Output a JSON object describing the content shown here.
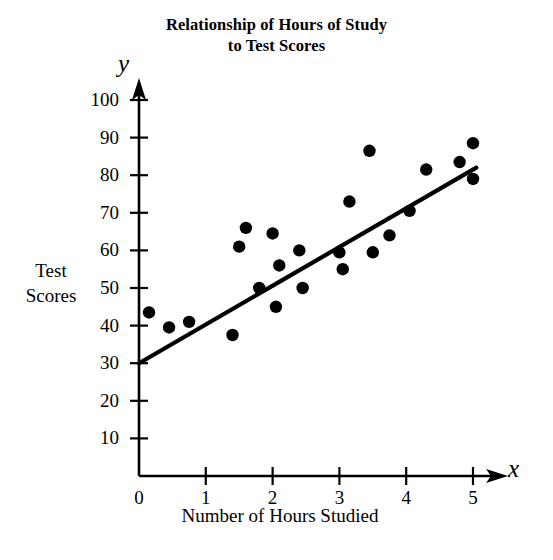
{
  "chart_data": {
    "type": "scatter",
    "title": "Relationship of Hours of Study to Test Scores",
    "title_lines": [
      "Relationship of Hours of Study",
      "to Test Scores"
    ],
    "xlabel": "Number of Hours Studied",
    "ylabel": "Test Scores",
    "x_axis_symbol": "x",
    "y_axis_symbol": "y",
    "xlim": [
      0,
      5.3
    ],
    "ylim": [
      0,
      105
    ],
    "xticks": [
      0,
      1,
      2,
      3,
      4,
      5
    ],
    "xtick_labels": [
      "0",
      "1",
      "2",
      "3",
      "4",
      "5"
    ],
    "yticks": [
      10,
      20,
      30,
      40,
      50,
      60,
      70,
      80,
      90,
      100
    ],
    "ytick_labels": [
      "10",
      "20",
      "30",
      "40",
      "50",
      "60",
      "70",
      "80",
      "90",
      "100"
    ],
    "grid": false,
    "legend": false,
    "marker_color": "#000000",
    "line_color": "#000000",
    "points": [
      {
        "x": 0.15,
        "y": 43.5
      },
      {
        "x": 0.45,
        "y": 39.5
      },
      {
        "x": 0.75,
        "y": 41.0
      },
      {
        "x": 1.4,
        "y": 37.5
      },
      {
        "x": 1.5,
        "y": 61.0
      },
      {
        "x": 1.6,
        "y": 66.0
      },
      {
        "x": 1.8,
        "y": 50.0
      },
      {
        "x": 2.0,
        "y": 64.5
      },
      {
        "x": 2.05,
        "y": 45.0
      },
      {
        "x": 2.1,
        "y": 56.0
      },
      {
        "x": 2.4,
        "y": 60.0
      },
      {
        "x": 2.45,
        "y": 50.0
      },
      {
        "x": 3.0,
        "y": 59.5
      },
      {
        "x": 3.05,
        "y": 55.0
      },
      {
        "x": 3.15,
        "y": 73.0
      },
      {
        "x": 3.45,
        "y": 86.5
      },
      {
        "x": 3.5,
        "y": 59.5
      },
      {
        "x": 3.75,
        "y": 64.0
      },
      {
        "x": 4.05,
        "y": 70.5
      },
      {
        "x": 4.3,
        "y": 81.5
      },
      {
        "x": 4.8,
        "y": 83.5
      },
      {
        "x": 5.0,
        "y": 88.5
      },
      {
        "x": 5.0,
        "y": 79.0
      }
    ],
    "trendline": {
      "name": "line of best fit",
      "x_start": 0.0,
      "y_start": 30.0,
      "x_end": 5.05,
      "y_end": 82.0
    }
  }
}
